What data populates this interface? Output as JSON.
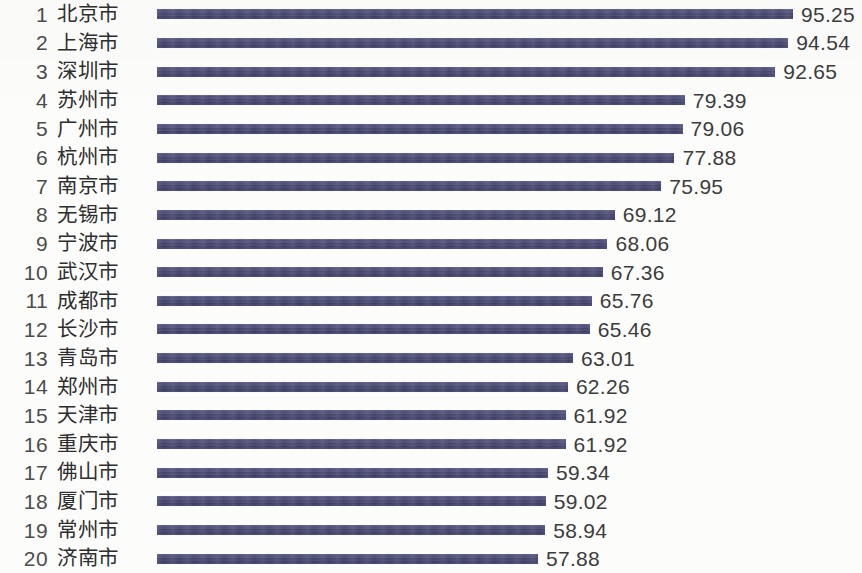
{
  "chart_data": {
    "type": "bar",
    "orientation": "horizontal",
    "title": "",
    "subtitle": "",
    "xlabel": "",
    "ylabel": "",
    "grid": false,
    "legend": null,
    "axis_visible": false,
    "value_labels_shown": true,
    "bar_color": "#494973",
    "text_color": "#3c3c3c",
    "background_color": "#fcfcfb",
    "xlim": [
      0,
      95.25
    ],
    "bar_start_px": 157,
    "bar_end_max_px": 793,
    "categories": [
      "北京市",
      "上海市",
      "深圳市",
      "苏州市",
      "广州市",
      "杭州市",
      "南京市",
      "无锡市",
      "宁波市",
      "武汉市",
      "成都市",
      "长沙市",
      "青岛市",
      "郑州市",
      "天津市",
      "重庆市",
      "佛山市",
      "厦门市",
      "常州市",
      "济南市"
    ],
    "values": [
      95.25,
      94.54,
      92.65,
      79.39,
      79.06,
      77.88,
      75.95,
      69.12,
      68.06,
      67.36,
      65.76,
      65.46,
      63.01,
      62.26,
      61.92,
      61.92,
      59.34,
      59.02,
      58.94,
      57.88
    ],
    "ranks": [
      1,
      2,
      3,
      4,
      5,
      6,
      7,
      8,
      9,
      10,
      11,
      12,
      13,
      14,
      15,
      16,
      17,
      18,
      19,
      20
    ]
  },
  "rows": [
    {
      "rank": "1",
      "city": "北京市",
      "value": "95.25",
      "number": 95.25
    },
    {
      "rank": "2",
      "city": "上海市",
      "value": "94.54",
      "number": 94.54
    },
    {
      "rank": "3",
      "city": "深圳市",
      "value": "92.65",
      "number": 92.65
    },
    {
      "rank": "4",
      "city": "苏州市",
      "value": "79.39",
      "number": 79.39
    },
    {
      "rank": "5",
      "city": "广州市",
      "value": "79.06",
      "number": 79.06
    },
    {
      "rank": "6",
      "city": "杭州市",
      "value": "77.88",
      "number": 77.88
    },
    {
      "rank": "7",
      "city": "南京市",
      "value": "75.95",
      "number": 75.95
    },
    {
      "rank": "8",
      "city": "无锡市",
      "value": "69.12",
      "number": 69.12
    },
    {
      "rank": "9",
      "city": "宁波市",
      "value": "68.06",
      "number": 68.06
    },
    {
      "rank": "10",
      "city": "武汉市",
      "value": "67.36",
      "number": 67.36
    },
    {
      "rank": "11",
      "city": "成都市",
      "value": "65.76",
      "number": 65.76
    },
    {
      "rank": "12",
      "city": "长沙市",
      "value": "65.46",
      "number": 65.46
    },
    {
      "rank": "13",
      "city": "青岛市",
      "value": "63.01",
      "number": 63.01
    },
    {
      "rank": "14",
      "city": "郑州市",
      "value": "62.26",
      "number": 62.26
    },
    {
      "rank": "15",
      "city": "天津市",
      "value": "61.92",
      "number": 61.92
    },
    {
      "rank": "16",
      "city": "重庆市",
      "value": "61.92",
      "number": 61.92
    },
    {
      "rank": "17",
      "city": "佛山市",
      "value": "59.34",
      "number": 59.34
    },
    {
      "rank": "18",
      "city": "厦门市",
      "value": "59.02",
      "number": 59.02
    },
    {
      "rank": "19",
      "city": "常州市",
      "value": "58.94",
      "number": 58.94
    },
    {
      "rank": "20",
      "city": "济南市",
      "value": "57.88",
      "number": 57.88
    }
  ]
}
